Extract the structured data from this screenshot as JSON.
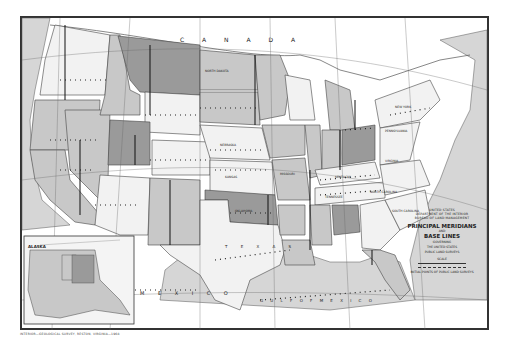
{
  "map": {
    "type": "historical reference map",
    "title_block": {
      "agency_line1": "UNITED STATES",
      "agency_line2": "DEPARTMENT OF THE INTERIOR",
      "bureau": "BUREAU OF LAND MANAGEMENT",
      "title_line1": "PRINCIPAL MERIDIANS",
      "title_and": "AND",
      "title_line2": "BASE LINES",
      "subtitle1": "GOVERNING",
      "subtitle2": "THE UNITED STATES",
      "subtitle3": "PUBLIC LAND SURVEYS",
      "scale_label": "SCALE",
      "legend_note": "INITIAL POINTS OF PUBLIC LAND SURVEYS"
    },
    "imprint": "INTERIOR—GEOLOGICAL SURVEY, RESTON, VIRGINIA—1968",
    "region_labels": {
      "canada": "C A N A D A",
      "mexico": "M E X I C O",
      "gulf": "G U L F   O F   M E X I C O",
      "texas": "T E X A S",
      "alaska": "ALASKA",
      "north_dakota": "NORTH DAKOTA",
      "new_york": "NEW YORK",
      "pennsylvania": "PENNSYLVANIA",
      "virginia": "VIRGINIA",
      "kentucky": "KENTUCKY",
      "north_carolina": "NORTH CAROLINA",
      "tennessee": "TENNESSEE",
      "south_carolina": "SOUTH CAROLINA",
      "oklahoma": "OKLAHOMA",
      "nebraska": "NEBRASKA",
      "kansas": "KANSAS",
      "missouri": "MISSOURI"
    },
    "colors": {
      "light": "#f2f2f2",
      "medium": "#c8c8c8",
      "dark": "#9a9a9a",
      "water": "#d6d6d6",
      "line": "#333333"
    }
  }
}
